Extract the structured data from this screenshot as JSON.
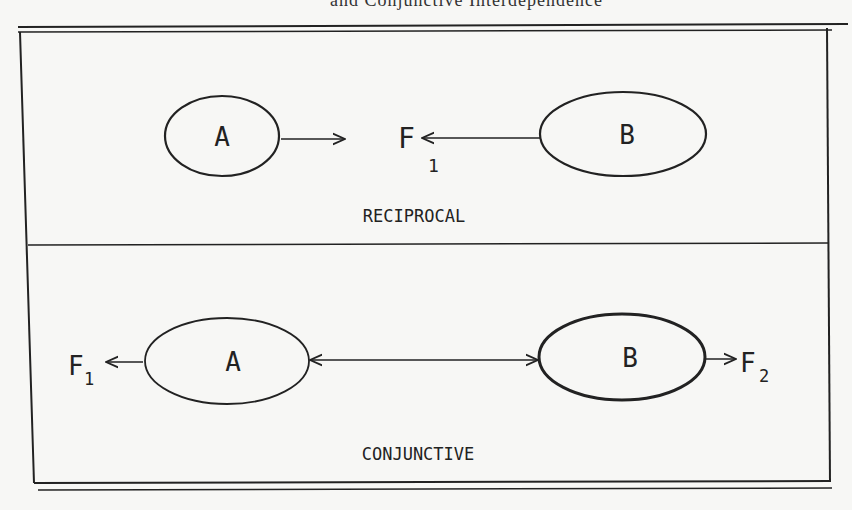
{
  "header": {
    "clipped_caption": "and Conjunctive Interdependence"
  },
  "panels": [
    {
      "title": "RECIPROCAL",
      "nodes": [
        {
          "id": "A",
          "label": "A"
        },
        {
          "id": "B",
          "label": "B"
        }
      ],
      "outcome": {
        "label": "F",
        "subscript": "1"
      }
    },
    {
      "title": "CONJUNCTIVE",
      "nodes": [
        {
          "id": "A",
          "label": "A"
        },
        {
          "id": "B",
          "label": "B"
        }
      ],
      "outcomes": [
        {
          "label": "F",
          "subscript": "1"
        },
        {
          "label": "F",
          "subscript": "2"
        }
      ]
    }
  ],
  "colors": {
    "ink": "#222222",
    "paper": "#f7f7f5"
  }
}
